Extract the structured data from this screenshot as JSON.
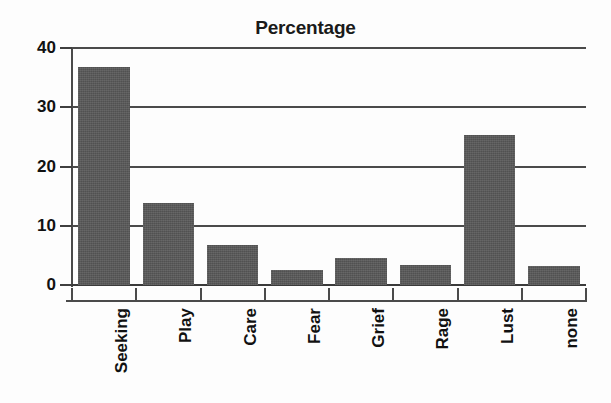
{
  "chart_data": {
    "type": "bar",
    "title": "Percentage",
    "xlabel": "",
    "ylabel": "",
    "categories": [
      "Seeking",
      "Play",
      "Care",
      "Fear",
      "Grief",
      "Rage",
      "Lust",
      "none"
    ],
    "values": [
      36.8,
      13.8,
      6.8,
      2.5,
      4.6,
      3.4,
      25.3,
      3.2
    ],
    "ylim": [
      0,
      40
    ],
    "ytick_labels": [
      "40",
      "30",
      "20",
      "10",
      "0"
    ],
    "yticks": [
      40,
      30,
      20,
      10,
      0
    ],
    "grid": "horizontal",
    "legend": "none",
    "bar_color": "#585858",
    "axis_color": "#4a4a4a",
    "text_color": "#111111",
    "background_color": "#fdfdfd"
  }
}
